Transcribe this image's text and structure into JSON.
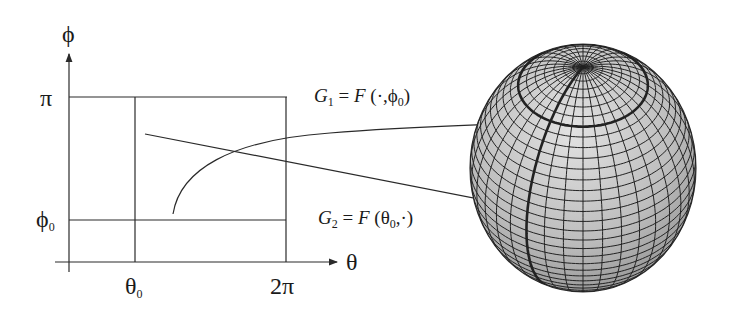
{
  "diagram": {
    "type": "parameter-domain-to-sphere-mapping",
    "left_plot": {
      "y_axis": {
        "label": "ϕ",
        "ticks": [
          {
            "label": "π",
            "sub": ""
          },
          {
            "label": "ϕ",
            "sub": "0"
          }
        ]
      },
      "x_axis": {
        "label": "θ",
        "ticks": [
          {
            "label": "θ",
            "sub": "0"
          },
          {
            "label": "2π",
            "sub": ""
          }
        ]
      }
    },
    "annotations": {
      "g1": {
        "lhs": "G",
        "lhs_sub": "1",
        "eq": "=",
        "fn": "F",
        "args_open": "(·,",
        "arg": "ϕ",
        "arg_sub": "0",
        "args_close": ")"
      },
      "g2": {
        "lhs": "G",
        "lhs_sub": "2",
        "eq": "=",
        "fn": "F",
        "args_open": "(",
        "arg": "θ",
        "arg_sub": "0",
        "args_close": ",·)"
      }
    },
    "colors": {
      "line": "#2a2a2a",
      "sphere_fill_light": "#d8d8d8",
      "sphere_fill_dark": "#8f8f8f",
      "grid": "#222222"
    }
  }
}
